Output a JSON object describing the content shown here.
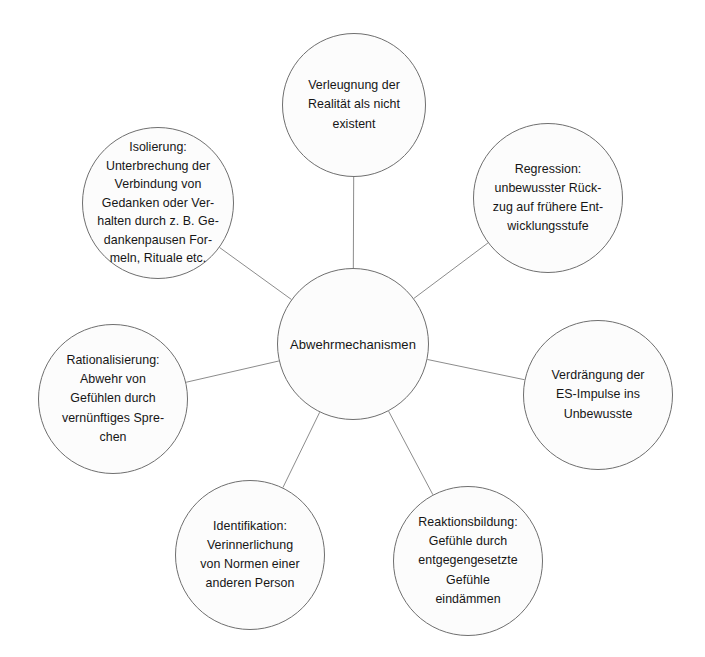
{
  "diagram": {
    "type": "radial-cluster",
    "title": "Abwehrmechanismen",
    "center": {
      "id": "abwehrmechanismen",
      "label": "Abwehrmechanismen",
      "cx": 353,
      "cy": 344,
      "r": 76
    },
    "nodes": [
      {
        "id": "verleugnung",
        "label": "Verleugnung der\nRealität als nicht\nexistent",
        "cx": 354,
        "cy": 105,
        "r": 72
      },
      {
        "id": "regression",
        "label": "Regression:\nunbewusster Rück-\nzug auf frühere Ent-\nwicklungsstufe",
        "cx": 548,
        "cy": 198,
        "r": 75
      },
      {
        "id": "verdraengung",
        "label": "Verdrängung der\nES-Impulse ins\nUnbewusste",
        "cx": 598,
        "cy": 395,
        "r": 75
      },
      {
        "id": "reaktionsbildung",
        "label": "Reaktionsbildung:\nGefühle durch\nentgegengesetzte\nGefühle\neindämmen",
        "cx": 468,
        "cy": 561,
        "r": 75
      },
      {
        "id": "identifikation",
        "label": "Identifikation:\nVerinnerlichung\nvon Normen einer\nanderen Person",
        "cx": 250,
        "cy": 555,
        "r": 75
      },
      {
        "id": "rationalisierung",
        "label": "Rationalisierung:\nAbwehr von\nGefühlen durch\nvernünftiges Spre-\nchen",
        "cx": 113,
        "cy": 399,
        "r": 75
      },
      {
        "id": "isolierung",
        "label": "Isolierung:\nUnterbrechung der\nVerbindung von\nGedanken oder Ver-\nhalten durch z. B. Ge-\ndankenpausen For-\nmeln, Rituale etc.",
        "cx": 158,
        "cy": 203,
        "r": 76
      }
    ],
    "edges": [
      {
        "from": "abwehrmechanismen",
        "to": "verleugnung"
      },
      {
        "from": "abwehrmechanismen",
        "to": "regression"
      },
      {
        "from": "abwehrmechanismen",
        "to": "verdraengung"
      },
      {
        "from": "abwehrmechanismen",
        "to": "reaktionsbildung"
      },
      {
        "from": "abwehrmechanismen",
        "to": "identifikation"
      },
      {
        "from": "abwehrmechanismen",
        "to": "rationalisierung"
      },
      {
        "from": "abwehrmechanismen",
        "to": "isolierung"
      }
    ],
    "colors": {
      "background": "#ffffff",
      "circle_fill": "#fcfcfc",
      "circle_stroke": "#6f6f6f",
      "edge_stroke": "#8c8c8c",
      "text": "#161616"
    }
  }
}
